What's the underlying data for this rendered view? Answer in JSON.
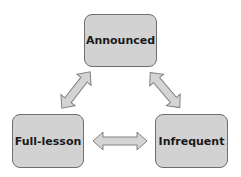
{
  "diagram": {
    "nodes": [
      {
        "id": "announced",
        "label": "Announced",
        "x": 84,
        "y": 14,
        "w": 73,
        "h": 53
      },
      {
        "id": "full-lesson",
        "label": "Full-lesson",
        "x": 12,
        "y": 114,
        "w": 72,
        "h": 54
      },
      {
        "id": "infrequent",
        "label": "Infrequent",
        "x": 155,
        "y": 114,
        "w": 73,
        "h": 54
      }
    ],
    "edges": [
      {
        "from": "announced",
        "to": "full-lesson",
        "type": "bidirectional"
      },
      {
        "from": "announced",
        "to": "infrequent",
        "type": "bidirectional"
      },
      {
        "from": "full-lesson",
        "to": "infrequent",
        "type": "bidirectional"
      }
    ],
    "colors": {
      "node_fill": "#d2d2d2",
      "node_border": "#6e6e6e",
      "arrow_fill": "#d4d4d4",
      "arrow_border": "#808080"
    }
  }
}
